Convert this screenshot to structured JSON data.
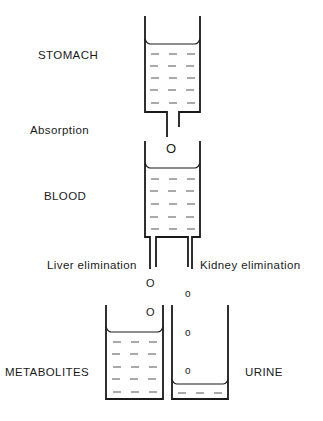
{
  "labels": {
    "stomach": "STOMACH",
    "absorption": "Absorption",
    "blood": "BLOOD",
    "liver_elimination": "Liver elimination",
    "kidney_elimination": "Kidney elimination",
    "metabolites": "METABOLITES",
    "urine": "URINE"
  },
  "particles": {
    "absorption_drop": "O",
    "liver_drop_1": "O",
    "liver_drop_2": "O",
    "kidney_drop_1": "o",
    "kidney_drop_2": "o",
    "kidney_drop_3": "o"
  },
  "compartments": [
    {
      "name": "stomach",
      "fill_level": "high"
    },
    {
      "name": "blood",
      "fill_level": "high"
    },
    {
      "name": "metabolites",
      "fill_level": "high"
    },
    {
      "name": "urine",
      "fill_level": "low"
    }
  ]
}
